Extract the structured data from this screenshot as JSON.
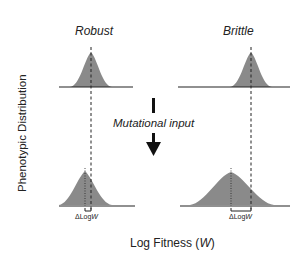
{
  "panels": {
    "left_title": "Robust",
    "right_title": "Brittle"
  },
  "axes": {
    "ylabel": "Phenotypic Distribution",
    "xlabel_prefix": "Log Fitness (",
    "xlabel_var": "W",
    "xlabel_suffix": ")"
  },
  "arrow": {
    "label": "Mutational input"
  },
  "annotations": {
    "delta_left_prefix": "ΔLog",
    "delta_left_var": "W",
    "delta_right_prefix": "ΔLog",
    "delta_right_var": "W"
  },
  "colors": {
    "fill": "#8a8a8a",
    "line": "#222222"
  }
}
